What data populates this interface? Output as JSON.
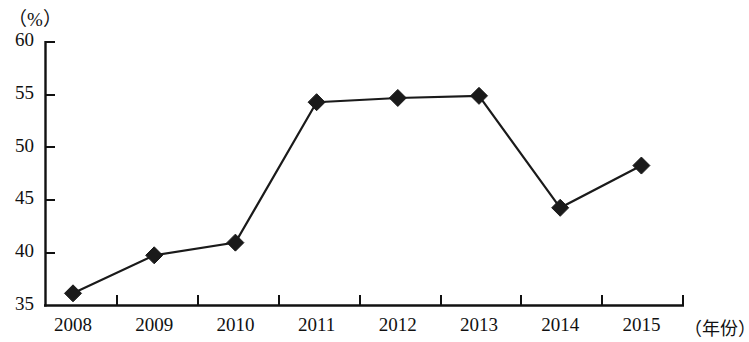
{
  "chart_data": {
    "type": "line",
    "title": "",
    "subtitle": "",
    "xlabel": "（年份）",
    "ylabel": "（%）",
    "categories": [
      "2008",
      "2009",
      "2010",
      "2011",
      "2012",
      "2013",
      "2014",
      "2015"
    ],
    "x": [
      2008,
      2009,
      2010,
      2011,
      2012,
      2013,
      2014,
      2015
    ],
    "values": [
      36.2,
      39.8,
      41.0,
      54.3,
      54.7,
      54.9,
      44.3,
      48.3
    ],
    "series": [
      {
        "name": "",
        "values": [
          36.2,
          39.8,
          41.0,
          54.3,
          54.7,
          54.9,
          44.3,
          48.3
        ]
      }
    ],
    "ylim": [
      35,
      60
    ],
    "ytick_labels": [
      "60",
      "55",
      "50",
      "45",
      "40",
      "35"
    ],
    "ytick_values": [
      60,
      55,
      50,
      45,
      40,
      35
    ],
    "grid": false,
    "legend": null,
    "legend_position": "none",
    "marker": "diamond",
    "marker_color": "#1a1a1a",
    "line_color": "#1a1a1a",
    "axis_color": "#111111",
    "background_color": "#ffffff"
  },
  "axes": {
    "y_unit": "（%）",
    "x_unit": "（年份）"
  }
}
